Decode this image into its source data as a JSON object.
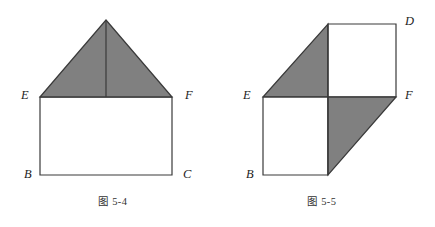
{
  "page": {
    "width": 435,
    "height": 227,
    "background_color": "#ffffff"
  },
  "style": {
    "stroke_color": "#3a3a3a",
    "shade_color": "#808080",
    "fill_color": "#ffffff",
    "stroke_width": 1.2,
    "label_color": "#1d1d1d",
    "caption_color": "#333333"
  },
  "figures": [
    {
      "id": "figure-5-4",
      "caption_prefix": "图",
      "caption_number": "5-4",
      "caption_full": "图 5-4",
      "description": "house shape: rectangle EBCF with shaded triangle roof, median line from apex to EF midpoint",
      "labels": [
        {
          "name": "E",
          "text": "E",
          "x": 21,
          "y": 89
        },
        {
          "name": "F",
          "text": "F",
          "x": 185,
          "y": 89
        },
        {
          "name": "B",
          "text": "B",
          "x": 24,
          "y": 168
        },
        {
          "name": "C",
          "text": "C",
          "x": 183,
          "y": 168
        }
      ],
      "vertices": {
        "apex": [
          106,
          20
        ],
        "E": [
          40,
          97
        ],
        "F": [
          172,
          97
        ],
        "B": [
          40,
          175
        ],
        "C": [
          172,
          175
        ],
        "EF_midpoint": [
          106,
          97
        ]
      },
      "shaded_regions": [
        "triangle apex-E-F"
      ],
      "white_regions": [
        "rectangle E-F-C-B"
      ]
    },
    {
      "id": "figure-5-5",
      "caption_prefix": "图",
      "caption_number": "5-5",
      "caption_full": "图 5-5",
      "description": "parallelogram split into two white squares and two shaded triangles",
      "labels": [
        {
          "name": "D",
          "text": "D",
          "x": 405,
          "y": 15
        },
        {
          "name": "E",
          "text": "E",
          "x": 243,
          "y": 89
        },
        {
          "name": "F",
          "text": "F",
          "x": 405,
          "y": 89
        },
        {
          "name": "B",
          "text": "B",
          "x": 246,
          "y": 168
        }
      ],
      "vertices": {
        "top_left_inner": [
          328,
          24
        ],
        "D": [
          396,
          24
        ],
        "E": [
          263,
          97
        ],
        "mid": [
          328,
          97
        ],
        "F": [
          396,
          97
        ],
        "B": [
          263,
          175
        ],
        "bottom_mid": [
          328,
          175
        ]
      },
      "shaded_regions": [
        "triangle E-topLeftInner-mid",
        "triangle mid-F-bottomMid"
      ],
      "white_regions": [
        "square topLeftInner-D-F-mid",
        "square E-mid-bottomMid-B"
      ]
    }
  ],
  "captions": [
    {
      "name": "caption-figure-5-4",
      "prefix": "图",
      "number": "5-4",
      "x": 98,
      "y": 196
    },
    {
      "name": "caption-figure-5-5",
      "prefix": "图",
      "number": "5-5",
      "x": 307,
      "y": 196
    }
  ]
}
